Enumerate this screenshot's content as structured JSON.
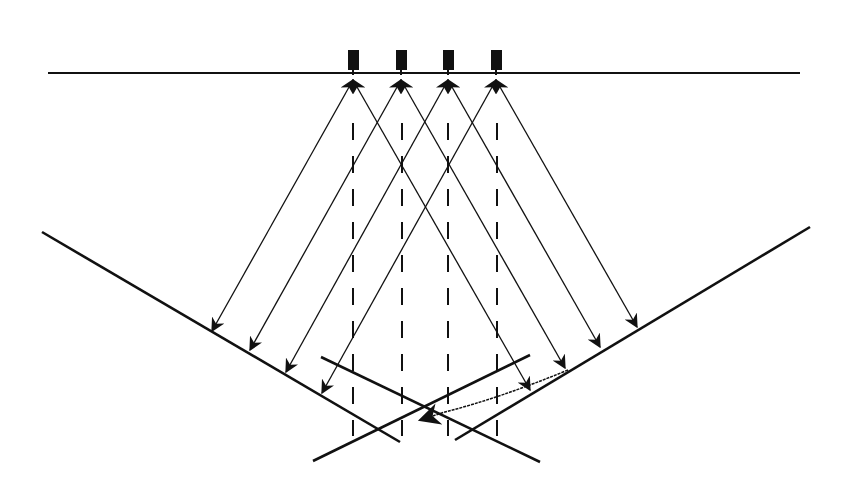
{
  "diagram": {
    "colors": {
      "stroke": "#111111",
      "background": "#ffffff"
    },
    "surface_line": {
      "x1": 48,
      "y1": 73,
      "x2": 800,
      "y2": 73
    },
    "transducers": [
      {
        "x": 353,
        "label": ""
      },
      {
        "x": 401,
        "label": ""
      },
      {
        "x": 448,
        "label": ""
      },
      {
        "x": 496,
        "label": ""
      }
    ],
    "reflectors": [
      {
        "name": "left-reflector",
        "x1": 42,
        "y1": 232,
        "x2": 400,
        "y2": 442
      },
      {
        "name": "right-reflector",
        "x1": 810,
        "y1": 227,
        "x2": 455,
        "y2": 440
      },
      {
        "name": "cross-line-a",
        "x1": 321,
        "y1": 357,
        "x2": 540,
        "y2": 462
      },
      {
        "name": "cross-line-b",
        "x1": 313,
        "y1": 461,
        "x2": 530,
        "y2": 355
      }
    ],
    "dashed_verticals": [
      353,
      402,
      448,
      497
    ],
    "rays": [
      {
        "from": [
          353,
          80
        ],
        "to": [
          212,
          331
        ]
      },
      {
        "from": [
          401,
          80
        ],
        "to": [
          250,
          350
        ]
      },
      {
        "from": [
          448,
          80
        ],
        "to": [
          286,
          372
        ]
      },
      {
        "from": [
          496,
          80
        ],
        "to": [
          322,
          393
        ]
      },
      {
        "from": [
          353,
          80
        ],
        "to": [
          530,
          390
        ]
      },
      {
        "from": [
          401,
          80
        ],
        "to": [
          565,
          368
        ]
      },
      {
        "from": [
          448,
          80
        ],
        "to": [
          600,
          347
        ]
      },
      {
        "from": [
          496,
          80
        ],
        "to": [
          637,
          327
        ]
      }
    ],
    "curved_ray": {
      "from": [
        568,
        370
      ],
      "to": [
        420,
        420
      ]
    }
  }
}
